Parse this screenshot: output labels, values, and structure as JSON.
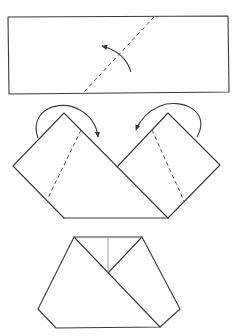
{
  "diagram": {
    "type": "folding-instructions",
    "steps": [
      {
        "id": "step-1",
        "description": "Rectangle with diagonal dashed fold line; curved arrow indicates folding the right part up and over to the left",
        "shape": "rectangle",
        "fold_lines": [
          "diagonal-dashed"
        ],
        "arrows": [
          "curved-fold-arrow-up-left"
        ]
      },
      {
        "id": "step-2",
        "description": "Two diamond-shaped flaps sharing a base; each has a dashed fold line and a curved arrow indicating folding the top corner inward",
        "shape": "double-peak",
        "fold_lines": [
          "left-flap-dashed",
          "right-flap-dashed"
        ],
        "arrows": [
          "left-arrow-fold-right",
          "right-arrow-fold-left"
        ]
      },
      {
        "id": "step-3",
        "description": "Resulting hexagonal folded shape with a diagonal overlap line and a thin vertical crease at the top",
        "shape": "hexagon",
        "fold_lines": [
          "diagonal-overlap",
          "vertical-crease"
        ],
        "arrows": []
      }
    ],
    "colors": {
      "stroke": "#3a3a3a",
      "dashed": "#5a5a5a",
      "crease": "#9a9a9a",
      "background": "#ffffff"
    }
  }
}
